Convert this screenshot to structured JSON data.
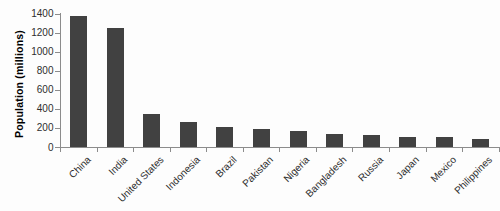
{
  "chart_data": {
    "type": "bar",
    "title": "",
    "ylabel": "Population (millions)",
    "xlabel": "",
    "categories": [
      "China",
      "India",
      "United States",
      "Indonesia",
      "Brazil",
      "Pakistan",
      "Nigeria",
      "Bangladesh",
      "Russia",
      "Japan",
      "Mexico",
      "Philippines"
    ],
    "values": [
      1370,
      1250,
      350,
      260,
      205,
      185,
      170,
      140,
      130,
      105,
      100,
      80
    ],
    "ylim": [
      0,
      1400
    ],
    "yticks": [
      0,
      200,
      400,
      600,
      800,
      1000,
      1200,
      1400
    ],
    "grid": false,
    "legend": false,
    "bar_color": "#414141",
    "axis_color": "#8c8c8c",
    "label_color": "#2e2e2e",
    "x_label_rotation_deg": -45
  }
}
